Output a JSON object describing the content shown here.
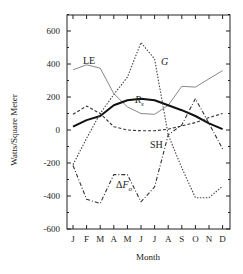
{
  "chart_data": {
    "type": "line",
    "title": "",
    "xlabel": "Month",
    "ylabel": "Watts/Square Meter",
    "ylim": [
      -600,
      700
    ],
    "yticks": [
      -600,
      -400,
      -200,
      0,
      200,
      400,
      600
    ],
    "ytick_labels": [
      "-600",
      "-400",
      "-200",
      "0",
      "200",
      "400",
      "600"
    ],
    "categories": [
      "J",
      "F",
      "M",
      "A",
      "M",
      "J",
      "J",
      "A",
      "S",
      "O",
      "N",
      "D"
    ],
    "grid": false,
    "legend": "inline labels",
    "series": [
      {
        "name": "LE",
        "label": "LE",
        "style": "solid-thin-gray",
        "color": "#888888",
        "values": [
          365,
          395,
          375,
          220,
          140,
          100,
          95,
          150,
          265,
          260,
          310,
          360
        ]
      },
      {
        "name": "Rs",
        "label": "R",
        "subscript": "s",
        "style": "solid-thick",
        "color": "#111111",
        "values": [
          20,
          60,
          85,
          150,
          180,
          190,
          180,
          150,
          120,
          85,
          40,
          5
        ]
      },
      {
        "name": "SH",
        "label": "SH",
        "style": "dashed",
        "color": "#333333",
        "values": [
          95,
          145,
          100,
          20,
          0,
          -5,
          -5,
          5,
          25,
          45,
          75,
          100
        ]
      },
      {
        "name": "G",
        "label": "G",
        "style": "dotted",
        "color": "#444444",
        "values": [
          -210,
          -50,
          100,
          215,
          320,
          530,
          430,
          -30,
          -230,
          -410,
          -410,
          -340
        ]
      },
      {
        "name": "ΔFo",
        "label": "ΔF",
        "subscript": "o",
        "style": "dash-dot",
        "color": "#333333",
        "values": [
          -215,
          -420,
          -445,
          -270,
          -270,
          -435,
          -345,
          -30,
          30,
          190,
          40,
          -115
        ]
      }
    ]
  }
}
